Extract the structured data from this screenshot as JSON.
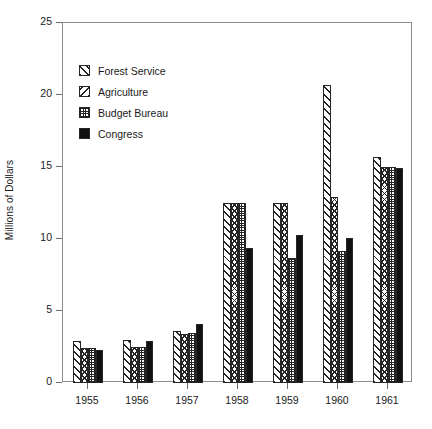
{
  "chart_data": {
    "type": "bar",
    "title": "",
    "xlabel": "",
    "ylabel": "Millions of Dollars",
    "categories": [
      "1955",
      "1956",
      "1957",
      "1958",
      "1959",
      "1960",
      "1961"
    ],
    "series": [
      {
        "name": "Forest Service",
        "pattern": "diagonal-hatch-forward",
        "values": [
          2.9,
          3.0,
          3.6,
          12.5,
          12.5,
          20.7,
          15.7
        ]
      },
      {
        "name": "Agriculture",
        "pattern": "diagonal-hatch-backward",
        "values": [
          2.4,
          2.5,
          3.4,
          12.5,
          12.5,
          12.9,
          15.0
        ]
      },
      {
        "name": "Budget Bureau",
        "pattern": "dotted-grid",
        "values": [
          2.4,
          2.5,
          3.5,
          12.5,
          8.7,
          9.2,
          15.0
        ]
      },
      {
        "name": "Congress",
        "pattern": "solid-black",
        "values": [
          2.3,
          2.9,
          4.1,
          9.4,
          10.3,
          10.1,
          14.9
        ]
      }
    ],
    "ylim": [
      0,
      25
    ],
    "yticks": [
      0,
      5,
      10,
      15,
      20,
      25
    ],
    "ytick_labels": [
      "0",
      "5",
      "10",
      "15",
      "20",
      "25"
    ],
    "grid": false,
    "legend_position": "upper-left-inside",
    "frame": true
  },
  "legend": {
    "entries": [
      {
        "label": "Forest Service",
        "swatch": "forest-service-swatch"
      },
      {
        "label": "Agriculture",
        "swatch": "agriculture-swatch"
      },
      {
        "label": "Budget Bureau",
        "swatch": "budget-bureau-swatch"
      },
      {
        "label": "Congress",
        "swatch": "congress-swatch"
      }
    ]
  },
  "caption": {
    "text": ""
  },
  "colors": {
    "ink": "#1a1a1a",
    "axis": "#8d8d8d",
    "bar_outline": "#262626",
    "solid_fill": "#111111",
    "background": "#ffffff"
  }
}
